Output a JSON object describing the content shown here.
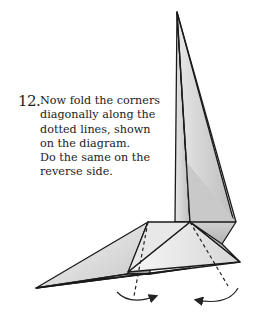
{
  "instruction": {
    "step_number": "12.",
    "lines": [
      "Now fold the corners",
      "diagonally along the",
      "dotted lines, shown",
      "on the diagram.",
      "Do the same on the",
      "reverse side."
    ]
  },
  "diagram": {
    "fold_lines": "dotted",
    "arrows": [
      "fold-arrow-left",
      "fold-arrow-right"
    ]
  }
}
